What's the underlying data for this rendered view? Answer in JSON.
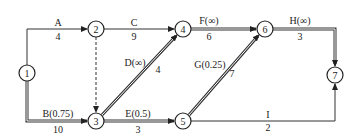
{
  "diagram": {
    "type": "activity-on-arrow network",
    "nodes": [
      {
        "id": "1",
        "label": "1",
        "x": 27,
        "y": 73
      },
      {
        "id": "2",
        "label": "2",
        "x": 96,
        "y": 29
      },
      {
        "id": "3",
        "label": "3",
        "x": 96,
        "y": 121
      },
      {
        "id": "4",
        "label": "4",
        "x": 183,
        "y": 29
      },
      {
        "id": "5",
        "label": "5",
        "x": 183,
        "y": 121
      },
      {
        "id": "6",
        "label": "6",
        "x": 265,
        "y": 29
      },
      {
        "id": "7",
        "label": "7",
        "x": 335,
        "y": 75
      }
    ],
    "edges": [
      {
        "id": "A",
        "from": "1",
        "to": "2",
        "name": "A",
        "duration": "4",
        "critical": false
      },
      {
        "id": "B",
        "from": "1",
        "to": "3",
        "name": "B(0.75)",
        "duration": "10",
        "critical": true
      },
      {
        "id": "dummy",
        "from": "2",
        "to": "3",
        "name": "",
        "duration": "",
        "dashed": true
      },
      {
        "id": "C",
        "from": "2",
        "to": "4",
        "name": "C",
        "duration": "9",
        "critical": false
      },
      {
        "id": "D",
        "from": "3",
        "to": "4",
        "name": "D(∞)",
        "duration": "4",
        "critical": true
      },
      {
        "id": "E",
        "from": "3",
        "to": "5",
        "name": "E(0.5)",
        "duration": "3",
        "critical": true
      },
      {
        "id": "F",
        "from": "4",
        "to": "6",
        "name": "F(∞)",
        "duration": "6",
        "critical": true
      },
      {
        "id": "G",
        "from": "5",
        "to": "6",
        "name": "G(0.25)",
        "duration": "7",
        "critical": true
      },
      {
        "id": "H",
        "from": "6",
        "to": "7",
        "name": "H(∞)",
        "duration": "3",
        "critical": true
      },
      {
        "id": "I",
        "from": "5",
        "to": "7",
        "name": "I",
        "duration": "2",
        "critical": false
      }
    ],
    "labels": {
      "A_name": "A",
      "A_dur": "4",
      "B_name": "B(0.75)",
      "B_dur": "10",
      "C_name": "C",
      "C_dur": "9",
      "D_name": "D(∞)",
      "D_dur": "4",
      "E_name": "E(0.5)",
      "E_dur": "3",
      "F_name": "F(∞)",
      "F_dur": "6",
      "G_name": "G(0.25)",
      "G_dur": "7",
      "H_name": "H(∞)",
      "H_dur": "3",
      "I_name": "I",
      "I_dur": "2",
      "n1": "1",
      "n2": "2",
      "n3": "3",
      "n4": "4",
      "n5": "5",
      "n6": "6",
      "n7": "7"
    }
  }
}
